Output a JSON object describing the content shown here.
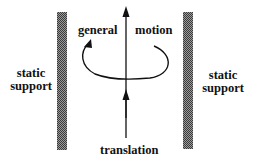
{
  "labels": {
    "left_support": [
      "static",
      "support"
    ],
    "right_support": [
      "static",
      "support"
    ],
    "general": "general",
    "motion": "motion",
    "translation": "translation"
  },
  "colors": {
    "ink": "#111111",
    "support_fill": "#6a6a6a"
  }
}
